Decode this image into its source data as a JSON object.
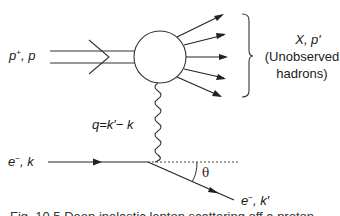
{
  "diagram": {
    "type": "feynman-diagram",
    "labels": {
      "proton_in_particle": "p",
      "proton_in_charge": "+",
      "proton_in_momentum": ", p",
      "hadrons_symbol": "X, p′",
      "hadrons_line1": "(Unobserved",
      "hadrons_line2": "hadrons)",
      "photon_momentum": "q=k′− k",
      "electron_in_particle": "e",
      "electron_in_charge": "−",
      "electron_in_momentum": ", k",
      "electron_out_particle": "e",
      "electron_out_charge": "−",
      "electron_out_momentum": ", k′",
      "scattering_angle": "θ"
    },
    "nodes": [
      {
        "id": "hadron-blob",
        "shape": "circle"
      },
      {
        "id": "electron-vertex",
        "shape": "point"
      }
    ],
    "edges": [
      {
        "from": "proton-in",
        "to": "hadron-blob",
        "style": "double-line-with-arrow"
      },
      {
        "from": "hadron-blob",
        "to": "outgoing-hadrons",
        "style": "arrows",
        "count": 5
      },
      {
        "from": "electron-vertex",
        "to": "hadron-blob",
        "style": "wavy (virtual photon)"
      },
      {
        "from": "electron-in",
        "to": "electron-vertex",
        "style": "line-with-arrow"
      },
      {
        "from": "electron-vertex",
        "to": "electron-out",
        "style": "line-with-arrow"
      },
      {
        "from": "electron-vertex",
        "to": "reference",
        "style": "dotted"
      }
    ],
    "caption": "Fig. 10.5  Deep inelastic lepton scattering off a proton"
  }
}
